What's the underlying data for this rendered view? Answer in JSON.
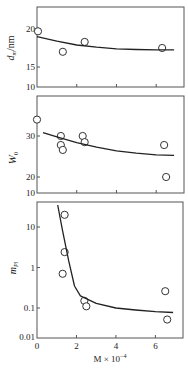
{
  "chart_data": [
    {
      "type": "scatter",
      "title": "",
      "xlabel": "M × 10^-4",
      "ylabel": "d_m/nm",
      "ylim": [
        10,
        23
      ],
      "xlim": [
        0,
        7.4
      ],
      "yticks": [
        10,
        15,
        20
      ],
      "ytick_labels": [
        "10",
        "15",
        "20"
      ],
      "grid": false,
      "series": [
        {
          "name": "data",
          "x": [
            0.05,
            1.3,
            2.4,
            6.3
          ],
          "y": [
            19.7,
            17.0,
            18.3,
            17.5
          ],
          "marker": "open-circle"
        },
        {
          "name": "fit",
          "x": [
            0,
            1,
            2,
            3,
            4,
            5,
            6,
            6.9
          ],
          "y": [
            19.0,
            18.4,
            17.9,
            17.6,
            17.4,
            17.3,
            17.25,
            17.25
          ],
          "style": "line"
        }
      ]
    },
    {
      "type": "scatter",
      "title": "",
      "xlabel": "M × 10^-4",
      "ylabel": "W_0",
      "ylim": [
        10,
        38
      ],
      "xlim": [
        0,
        7.4
      ],
      "yticks": [
        10,
        20,
        30
      ],
      "ytick_labels": [
        "10",
        "20",
        "30"
      ],
      "grid": false,
      "series": [
        {
          "name": "data",
          "x": [
            0,
            1.2,
            1.2,
            1.3,
            2.3,
            2.4,
            6.4,
            6.5
          ],
          "y": [
            34,
            30,
            27.8,
            26.6,
            30,
            28.5,
            27.8,
            20
          ],
          "marker": "open-circle"
        },
        {
          "name": "fit",
          "x": [
            0.3,
            1,
            2,
            3,
            4,
            5,
            6,
            6.9
          ],
          "y": [
            30.8,
            29.8,
            28.4,
            27.3,
            26.4,
            25.8,
            25.4,
            25.3
          ],
          "style": "line"
        }
      ]
    },
    {
      "type": "scatter",
      "title": "",
      "xlabel": "M × 10^-4",
      "ylabel": "m_Pl",
      "yscale": "log",
      "ylim": [
        0.01,
        50
      ],
      "xlim": [
        0,
        7.4
      ],
      "yticks": [
        0.01,
        0.1,
        1,
        10
      ],
      "ytick_labels": [
        "0.01",
        "0.1",
        "1",
        "10"
      ],
      "xticks": [
        0,
        2,
        4,
        6
      ],
      "xtick_labels": [
        "0",
        "2",
        "4",
        "6"
      ],
      "grid": false,
      "series": [
        {
          "name": "data",
          "x": [
            1.4,
            1.4,
            1.3,
            2.4,
            2.5,
            6.5,
            6.6
          ],
          "y": [
            20,
            2.4,
            0.7,
            0.15,
            0.11,
            0.26,
            0.04
          ],
          "marker": "open-circle"
        },
        {
          "name": "fit",
          "x": [
            1.05,
            1.3,
            1.6,
            1.9,
            2.2,
            3,
            4,
            5,
            6,
            6.9
          ],
          "y": [
            35,
            8,
            1.5,
            0.35,
            0.2,
            0.13,
            0.1,
            0.085,
            0.075,
            0.07
          ],
          "style": "line"
        }
      ]
    }
  ],
  "labels": {
    "panel1_ylabel_main": "d",
    "panel1_ylabel_sub": "m",
    "panel1_ylabel_unit": "/nm",
    "panel2_ylabel_main": "W",
    "panel2_ylabel_sub": "0",
    "panel3_ylabel_main": "m",
    "panel3_ylabel_sub": "Pl",
    "xlabel_main": "M × 10",
    "xlabel_exp": "−4"
  }
}
